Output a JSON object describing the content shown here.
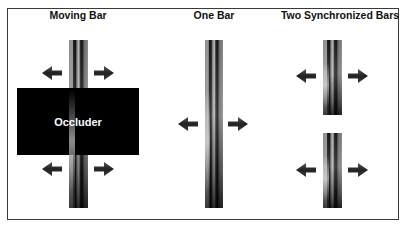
{
  "panels": {
    "moving_bar": {
      "title": "Moving Bar",
      "occluder_label": "Occluder"
    },
    "one_bar": {
      "title": "One Bar"
    },
    "two_bars": {
      "title": "Two Synchronized Bars"
    }
  },
  "icons": {
    "left_arrow": "arrow-left-icon",
    "right_arrow": "arrow-right-icon"
  },
  "colors": {
    "frame": "#3a3a3a",
    "occluder": "#000000",
    "arrow": "#2e2e2e",
    "background": "#ffffff"
  }
}
